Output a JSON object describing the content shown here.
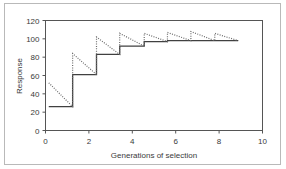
{
  "chart_data": {
    "type": "line",
    "title": "",
    "xlabel": "Generations of selection",
    "ylabel": "Response",
    "xlim": [
      0,
      10
    ],
    "ylim": [
      0,
      120
    ],
    "xticks": [
      0,
      2,
      4,
      6,
      8,
      10
    ],
    "yticks": [
      0,
      20,
      40,
      60,
      80,
      100,
      120
    ],
    "grid": false,
    "legend": null,
    "series": [
      {
        "name": "Cumulative response (step)",
        "style": "solid",
        "color": "#404040",
        "points": [
          [
            0.15,
            26
          ],
          [
            1.25,
            26
          ],
          [
            1.25,
            61
          ],
          [
            2.35,
            61
          ],
          [
            2.35,
            83
          ],
          [
            3.42,
            83
          ],
          [
            3.42,
            92
          ],
          [
            4.55,
            92
          ],
          [
            4.55,
            97
          ],
          [
            5.62,
            97
          ],
          [
            5.62,
            98
          ],
          [
            6.7,
            98
          ],
          [
            6.7,
            98
          ],
          [
            7.8,
            98
          ],
          [
            7.8,
            98
          ],
          [
            8.88,
            98
          ]
        ]
      },
      {
        "name": "Within-generation response (sawtooth)",
        "style": "dotted",
        "color": "#6b6b6b",
        "points": [
          [
            0.15,
            52
          ],
          [
            1.25,
            26
          ],
          [
            1.25,
            84
          ],
          [
            2.35,
            61
          ],
          [
            2.35,
            102
          ],
          [
            3.42,
            83
          ],
          [
            3.42,
            106
          ],
          [
            4.55,
            92
          ],
          [
            4.55,
            106
          ],
          [
            5.62,
            97
          ],
          [
            5.62,
            107
          ],
          [
            6.7,
            98
          ],
          [
            6.7,
            108
          ],
          [
            7.8,
            98
          ],
          [
            7.8,
            106
          ],
          [
            8.88,
            98
          ]
        ]
      }
    ]
  },
  "axis": {
    "ylabel": "Response",
    "xlabel": "Generations of selection",
    "ytick_labels": [
      "0",
      "20",
      "40",
      "60",
      "80",
      "100",
      "120"
    ],
    "xtick_labels": [
      "0",
      "2",
      "4",
      "6",
      "8",
      "10"
    ]
  },
  "colors": {
    "frame": "#b9b9b9",
    "axis": "#555555",
    "solid_series": "#404040",
    "dotted_series": "#6b6b6b",
    "text": "#3a3a3a",
    "background": "#ffffff"
  }
}
